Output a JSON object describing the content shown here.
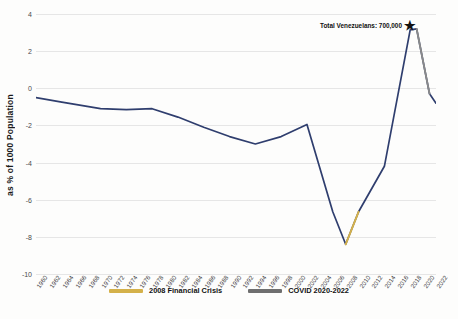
{
  "chart_data": {
    "type": "line",
    "title": "",
    "xlabel": "",
    "ylabel": "as % of 1000 Population",
    "ylim": [
      -10,
      4
    ],
    "yticks": [
      4,
      2,
      0,
      -2,
      -4,
      -6,
      -8,
      -10
    ],
    "xlim": [
      1960,
      2022
    ],
    "grid": true,
    "legend_position": "bottom-center",
    "categories": [
      "1960",
      "1962",
      "1964",
      "1966",
      "1968",
      "1970",
      "1972",
      "1974",
      "1976",
      "1978",
      "1980",
      "1982",
      "1984",
      "1986",
      "1988",
      "1990",
      "1992",
      "1994",
      "1996",
      "1998",
      "2000",
      "2002",
      "2004",
      "2006",
      "2008",
      "2010",
      "2012",
      "2014",
      "2016",
      "2018",
      "2020",
      "2022"
    ],
    "series": [
      {
        "name": "Net migration rate",
        "color": "#2f3e6e",
        "x": [
          1960,
          1964,
          1970,
          1974,
          1978,
          1982,
          1986,
          1990,
          1994,
          1998,
          2002,
          2006,
          2008,
          2010,
          2014,
          2018,
          2019,
          2021,
          2022
        ],
        "values": [
          -0.5,
          -0.75,
          -1.1,
          -1.15,
          -1.1,
          -1.55,
          -2.1,
          -2.6,
          -3.0,
          -2.6,
          -1.95,
          -6.65,
          -8.4,
          -6.65,
          -4.2,
          3.15,
          3.2,
          -0.3,
          -0.8
        ]
      }
    ],
    "highlight_segments": [
      {
        "name": "2008 Financial Crisis",
        "color": "#d4b14a",
        "x_from": 2008,
        "x_to": 2010,
        "y_from": -8.4,
        "y_to": -6.65
      },
      {
        "name": "COVID 2020-2022",
        "color": "#8a8a8a",
        "x_from": 2019,
        "x_to": 2021,
        "y_from": 3.2,
        "y_to": -0.3
      }
    ],
    "annotations": [
      {
        "name": "total-venezuelans",
        "text": "Total Venezuelans: 700,000",
        "marker": "star",
        "marker_color": "#111111",
        "x": 2019,
        "y": 3.6
      }
    ]
  },
  "legend": {
    "items": [
      {
        "label": "2008 Financial Crisis",
        "color": "#d4b14a"
      },
      {
        "label": "COVID 2020-2022",
        "color": "#6f6f6f"
      }
    ]
  },
  "caption": {
    "text": ""
  },
  "icons": {
    "star": "★"
  }
}
